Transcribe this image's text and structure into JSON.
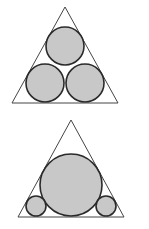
{
  "colors": {
    "background": "#ffffff",
    "triangle_stroke": "#444444",
    "circle_stroke": "#2a2a2a",
    "circle_fill": "#c8c8c8"
  },
  "figures": [
    {
      "name": "three-equal-circles-in-triangle",
      "triangle": [
        [
          65,
          7
        ],
        [
          12,
          103
        ],
        [
          118,
          103
        ]
      ],
      "circles": [
        {
          "cx": 65,
          "cy": 46,
          "r": 19
        },
        {
          "cx": 45,
          "cy": 83,
          "r": 19
        },
        {
          "cx": 85,
          "cy": 83,
          "r": 19
        }
      ]
    },
    {
      "name": "one-large-two-small-circles-in-triangle",
      "triangle": [
        [
          71,
          120
        ],
        [
          18,
          217
        ],
        [
          124,
          217
        ]
      ],
      "circles": [
        {
          "cx": 71,
          "cy": 185,
          "r": 31
        },
        {
          "cx": 36,
          "cy": 206,
          "r": 10
        },
        {
          "cx": 106,
          "cy": 206,
          "r": 10
        }
      ]
    }
  ]
}
